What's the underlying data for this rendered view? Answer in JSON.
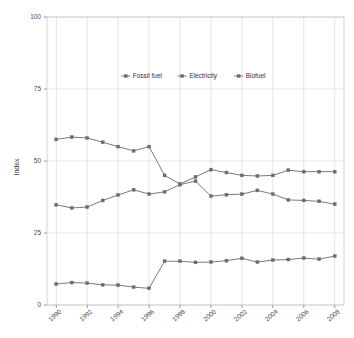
{
  "chart_data": {
    "type": "line",
    "title": "",
    "subtitle": "",
    "xlabel": "",
    "ylabel": "Index",
    "x": [
      1990,
      1991,
      1992,
      1993,
      1994,
      1995,
      1996,
      1997,
      1998,
      1999,
      2000,
      2001,
      2002,
      2003,
      2004,
      2005,
      2006,
      2007,
      2008
    ],
    "xlim": [
      1989.4,
      2008.6
    ],
    "ylim": [
      0,
      100
    ],
    "xticks": [
      1990,
      1992,
      1994,
      1996,
      1998,
      2000,
      2002,
      2004,
      2006,
      2008
    ],
    "xtick_labels": [
      "1990",
      "1992",
      "1994",
      "1996",
      "1998",
      "2000",
      "2002",
      "2004",
      "2006",
      "2008"
    ],
    "yticks": [
      0,
      25,
      50,
      75,
      100
    ],
    "ytick_labels": [
      "0",
      "25",
      "50",
      "75",
      "100"
    ],
    "grid": true,
    "grid_color": "#d9d9d9",
    "legend_position": "top-center",
    "marker": "square",
    "series": [
      {
        "name": "Fossil fuel",
        "color": "#6b6b6b",
        "values": [
          57.5,
          58.3,
          58.0,
          56.5,
          55.0,
          53.5,
          55.0,
          45.0,
          42.0,
          44.5,
          47.0,
          46.0,
          45.0,
          44.8,
          45.0,
          46.8,
          46.3,
          46.3,
          46.3
        ]
      },
      {
        "name": "Electricity",
        "color": "#6b6b6b",
        "values": [
          34.8,
          33.7,
          34.0,
          36.3,
          38.2,
          40.0,
          38.5,
          39.3,
          41.8,
          43.0,
          37.8,
          38.3,
          38.5,
          39.8,
          38.5,
          36.5,
          36.3,
          36.0,
          35.0
        ]
      },
      {
        "name": "Biofuel",
        "color": "#6b6b6b",
        "values": [
          7.3,
          7.8,
          7.6,
          7.0,
          6.9,
          6.2,
          5.8,
          15.2,
          15.2,
          14.8,
          14.9,
          15.4,
          16.2,
          14.9,
          15.6,
          15.8,
          16.3,
          15.9,
          17.0
        ]
      }
    ]
  },
  "legend": {
    "items": [
      {
        "label": "Fossil fuel"
      },
      {
        "label": "Electricity"
      },
      {
        "label": "Biofuel"
      }
    ]
  },
  "axes": {
    "y_title": "Index"
  }
}
